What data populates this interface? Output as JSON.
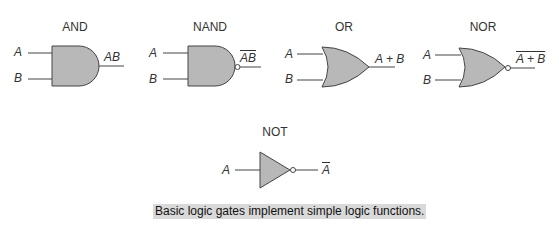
{
  "gates": [
    {
      "name": "AND",
      "inputs": [
        "A",
        "B"
      ],
      "output": "AB",
      "output_inverted": false
    },
    {
      "name": "NAND",
      "inputs": [
        "A",
        "B"
      ],
      "output": "AB",
      "output_inverted": true
    },
    {
      "name": "OR",
      "inputs": [
        "A",
        "B"
      ],
      "output": "A + B",
      "output_inverted": false
    },
    {
      "name": "NOR",
      "inputs": [
        "A",
        "B"
      ],
      "output": "A + B",
      "output_inverted": true
    },
    {
      "name": "NOT",
      "inputs": [
        "A"
      ],
      "output": "A",
      "output_inverted": true
    }
  ],
  "caption": "Basic logic gates implement simple logic functions.",
  "colors": {
    "gate_fill": "#b8b8b8",
    "stroke": "#444444",
    "caption_bg": "#d9d9d9"
  }
}
